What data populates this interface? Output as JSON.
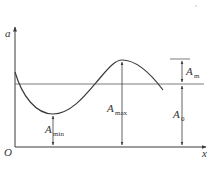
{
  "diagram": {
    "type": "amplitude-waveform",
    "axes": {
      "y_label": "a",
      "x_label": "x",
      "origin_label": "O"
    },
    "annotations": [
      {
        "id": "a_m",
        "symbol": "A",
        "subscript": "m"
      },
      {
        "id": "a_0",
        "symbol": "A",
        "subscript": "0"
      },
      {
        "id": "a_max",
        "symbol": "A",
        "subscript": "max"
      },
      {
        "id": "a_min",
        "symbol": "A",
        "subscript": "min"
      }
    ],
    "colors": {
      "line": "#3a3a3a",
      "guide": "#8a8a8a"
    }
  }
}
